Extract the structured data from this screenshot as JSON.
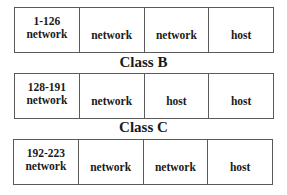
{
  "diagram": {
    "tables": [
      {
        "range": "1-126",
        "cells": [
          "network",
          "network",
          "network",
          "host"
        ]
      },
      {
        "range": "128-191",
        "cells": [
          "network",
          "network",
          "host",
          "host"
        ]
      },
      {
        "range": "192-223",
        "cells": [
          "network",
          "network",
          "network",
          "host"
        ]
      }
    ],
    "labels": {
      "class_b": "Class B",
      "class_c": "Class C"
    },
    "colors": {
      "border": "#5a5a5a",
      "text": "#1a1a1a",
      "background": "#ffffff"
    }
  }
}
